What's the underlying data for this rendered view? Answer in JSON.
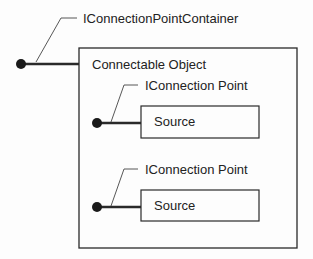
{
  "diagram": {
    "container_interface": {
      "label": "IConnectionPointContainer"
    },
    "object": {
      "label": "Connectable Object"
    },
    "connection_points": [
      {
        "interface_label": "IConnection Point",
        "source_label": "Source"
      },
      {
        "interface_label": "IConnection Point",
        "source_label": "Source"
      }
    ]
  },
  "colors": {
    "stroke": "#2a2a2a",
    "text": "#222222",
    "background": "#fdfdfd"
  }
}
